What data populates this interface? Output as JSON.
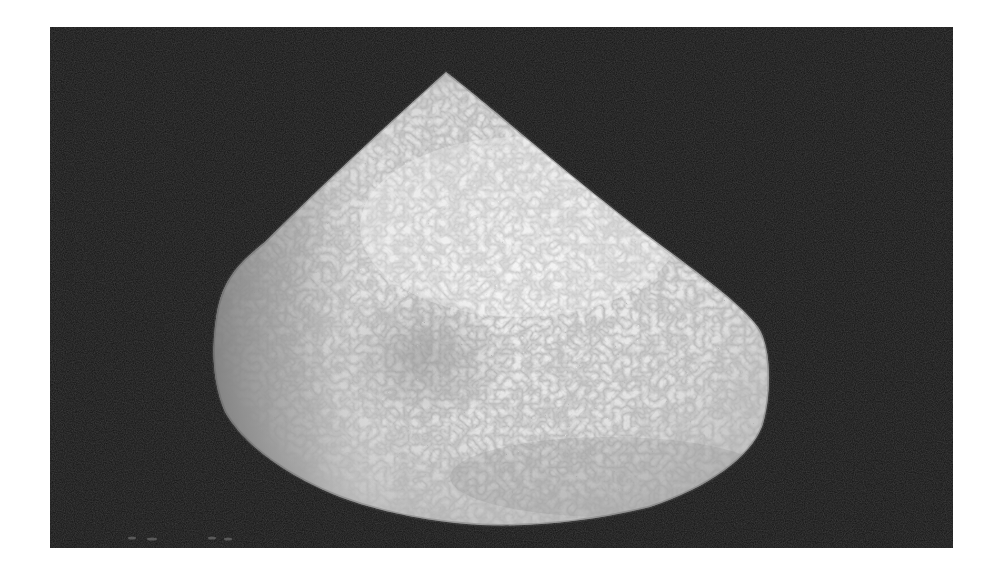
{
  "image": {
    "subject": "specimen",
    "description": "Black-and-white photograph of a pale, granular, cone-shaped specimen on a black background",
    "colors": {
      "page_background": "#ffffff",
      "photo_background": "#141414",
      "specimen_light": "#eeeeee",
      "specimen_mid": "#cfcfcf",
      "specimen_shadow": "#8a8a8a"
    }
  }
}
